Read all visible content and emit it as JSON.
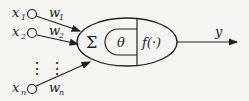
{
  "diagram": {
    "type": "neuron-model",
    "inputs": [
      {
        "label": "x",
        "sub": "1",
        "weight": "w",
        "wsub": "1"
      },
      {
        "label": "x",
        "sub": "2",
        "weight": "w",
        "wsub": "2"
      },
      {
        "label": "x",
        "sub": "n",
        "weight": "w",
        "wsub": "n"
      }
    ],
    "ellipsis": "⋮",
    "sum_symbol": "Σ",
    "threshold_symbol": "θ",
    "activation_label": "f(·)",
    "output_label": "y",
    "stroke_color": "#222222",
    "background_color": "#f4f4f2"
  }
}
